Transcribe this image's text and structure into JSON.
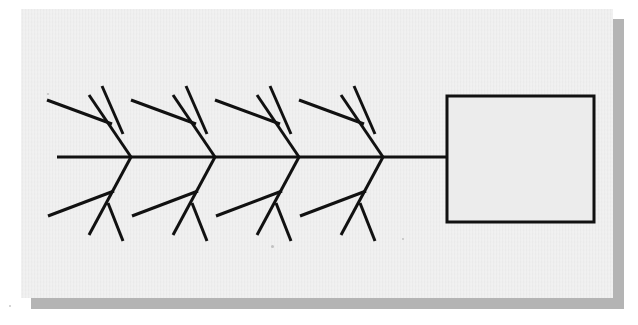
{
  "canvas": {
    "width": 638,
    "height": 325
  },
  "colors": {
    "page_background": "#ffffff",
    "card_background": "#ececec",
    "card_shadow": "#b4b4b4",
    "ink": "#111111"
  },
  "card": {
    "x": 21,
    "y": 9,
    "width": 592,
    "height": 289,
    "shadow_offset_x": 10,
    "shadow_offset_y": 10
  },
  "diagram": {
    "type": "fishbone-ishikawa",
    "title": "",
    "spine": {
      "x1": 57,
      "y1": 157,
      "x2": 447,
      "y2": 157,
      "stroke_width": 3.2
    },
    "effect_box": {
      "label": "",
      "x": 447,
      "y": 96,
      "width": 147,
      "height": 126,
      "stroke_width": 3.0,
      "fill": "#ececec"
    },
    "rib_stroke_width": 3.0,
    "twig_stroke_width": 3.0,
    "ribs": [
      {
        "name": "rib-top-1",
        "side": "top",
        "label": "",
        "junction": {
          "x": 131,
          "y": 157
        },
        "tip": {
          "x": 89,
          "y": 95
        },
        "twigs": [
          {
            "name": "twig-top-1a",
            "label": "",
            "x1": 47,
            "y1": 100,
            "x2": 112,
            "y2": 124
          },
          {
            "name": "twig-top-1b",
            "label": "",
            "x1": 102,
            "y1": 86,
            "x2": 123,
            "y2": 134
          }
        ]
      },
      {
        "name": "rib-top-2",
        "side": "top",
        "label": "",
        "junction": {
          "x": 215,
          "y": 157
        },
        "tip": {
          "x": 173,
          "y": 95
        },
        "twigs": [
          {
            "name": "twig-top-2a",
            "label": "",
            "x1": 131,
            "y1": 100,
            "x2": 196,
            "y2": 124
          },
          {
            "name": "twig-top-2b",
            "label": "",
            "x1": 186,
            "y1": 86,
            "x2": 207,
            "y2": 134
          }
        ]
      },
      {
        "name": "rib-top-3",
        "side": "top",
        "label": "",
        "junction": {
          "x": 299,
          "y": 157
        },
        "tip": {
          "x": 257,
          "y": 95
        },
        "twigs": [
          {
            "name": "twig-top-3a",
            "label": "",
            "x1": 215,
            "y1": 100,
            "x2": 280,
            "y2": 124
          },
          {
            "name": "twig-top-3b",
            "label": "",
            "x1": 270,
            "y1": 86,
            "x2": 291,
            "y2": 134
          }
        ]
      },
      {
        "name": "rib-top-4",
        "side": "top",
        "label": "",
        "junction": {
          "x": 383,
          "y": 157
        },
        "tip": {
          "x": 341,
          "y": 95
        },
        "twigs": [
          {
            "name": "twig-top-4a",
            "label": "",
            "x1": 299,
            "y1": 100,
            "x2": 364,
            "y2": 124
          },
          {
            "name": "twig-top-4b",
            "label": "",
            "x1": 354,
            "y1": 86,
            "x2": 375,
            "y2": 134
          }
        ]
      },
      {
        "name": "rib-bottom-1",
        "side": "bottom",
        "label": "",
        "junction": {
          "x": 131,
          "y": 157
        },
        "tip": {
          "x": 89,
          "y": 235
        },
        "twigs": [
          {
            "name": "twig-bottom-1a",
            "label": "",
            "x1": 48,
            "y1": 216,
            "x2": 114,
            "y2": 191
          },
          {
            "name": "twig-bottom-1b",
            "label": "",
            "x1": 108,
            "y1": 203,
            "x2": 123,
            "y2": 241
          }
        ]
      },
      {
        "name": "rib-bottom-2",
        "side": "bottom",
        "label": "",
        "junction": {
          "x": 215,
          "y": 157
        },
        "tip": {
          "x": 173,
          "y": 235
        },
        "twigs": [
          {
            "name": "twig-bottom-2a",
            "label": "",
            "x1": 132,
            "y1": 216,
            "x2": 198,
            "y2": 191
          },
          {
            "name": "twig-bottom-2b",
            "label": "",
            "x1": 192,
            "y1": 203,
            "x2": 207,
            "y2": 241
          }
        ]
      },
      {
        "name": "rib-bottom-3",
        "side": "bottom",
        "label": "",
        "junction": {
          "x": 299,
          "y": 157
        },
        "tip": {
          "x": 257,
          "y": 235
        },
        "twigs": [
          {
            "name": "twig-bottom-3a",
            "label": "",
            "x1": 216,
            "y1": 216,
            "x2": 282,
            "y2": 191
          },
          {
            "name": "twig-bottom-3b",
            "label": "",
            "x1": 276,
            "y1": 203,
            "x2": 291,
            "y2": 241
          }
        ]
      },
      {
        "name": "rib-bottom-4",
        "side": "bottom",
        "label": "",
        "junction": {
          "x": 383,
          "y": 157
        },
        "tip": {
          "x": 341,
          "y": 235
        },
        "twigs": [
          {
            "name": "twig-bottom-4a",
            "label": "",
            "x1": 300,
            "y1": 216,
            "x2": 366,
            "y2": 191
          },
          {
            "name": "twig-bottom-4b",
            "label": "",
            "x1": 360,
            "y1": 203,
            "x2": 375,
            "y2": 241
          }
        ]
      }
    ],
    "specks": [
      {
        "x": 271,
        "y": 245,
        "size": 3
      },
      {
        "x": 402,
        "y": 238,
        "size": 2
      },
      {
        "x": 9,
        "y": 305,
        "size": 2
      },
      {
        "x": 47,
        "y": 93,
        "size": 2
      }
    ]
  }
}
